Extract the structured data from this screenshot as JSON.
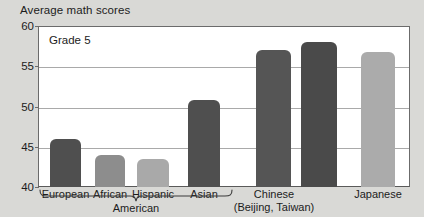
{
  "chart_data": {
    "type": "bar",
    "title": "Average math scores",
    "xlabel": "",
    "ylabel": "",
    "ylim": [
      40,
      60
    ],
    "yticks": [
      40,
      45,
      50,
      55,
      60
    ],
    "grid": true,
    "legend": false,
    "annotations": [
      {
        "text": "Grade 5",
        "position": "top-left-inside-plot"
      },
      {
        "text": "American",
        "position": "brace-below-first-four-bars"
      }
    ],
    "categories": [
      "European",
      "African",
      "Hispanic",
      "Asian",
      "Chinese (Beijing)",
      "Chinese (Taiwan)",
      "Japanese"
    ],
    "values": [
      46.0,
      44.0,
      43.5,
      50.8,
      57.0,
      58.0,
      56.8
    ],
    "bars": [
      {
        "label": "European",
        "value": 46.0,
        "color": "#4f4f4f",
        "x": 50,
        "width": 31
      },
      {
        "label": "African",
        "value": 44.0,
        "color": "#8d8d8d",
        "x": 95,
        "width": 30
      },
      {
        "label": "Hispanic",
        "value": 43.5,
        "color": "#a9a9a9",
        "x": 137,
        "width": 32
      },
      {
        "label": "Asian",
        "value": 50.8,
        "color": "#4f4f4f",
        "x": 188,
        "width": 32
      },
      {
        "label": "Chinese (Beijing)",
        "value": 57.0,
        "color": "#555555",
        "x": 256,
        "width": 35
      },
      {
        "label": "Chinese (Taiwan)",
        "value": 58.0,
        "color": "#4a4a4a",
        "x": 301,
        "width": 36
      },
      {
        "label": "Japanese",
        "value": 56.8,
        "color": "#ababab",
        "x": 361,
        "width": 34
      }
    ],
    "group_labels": [
      {
        "text": "American",
        "center_x": 136
      },
      {
        "text": "Chinese",
        "center_x": 274
      },
      {
        "text": "(Beijing, Taiwan)",
        "center_x": 274
      },
      {
        "text": "Japanese",
        "center_x": 378
      }
    ],
    "tick_labels": [
      "European",
      "African",
      "Hispanic",
      "Asian"
    ],
    "colors": {
      "background": "#d9d9d6",
      "plot_background": "#ffffff",
      "gridline": "#a9a9a9",
      "axis": "#6b6b6b",
      "text": "#1c1c1c"
    }
  }
}
